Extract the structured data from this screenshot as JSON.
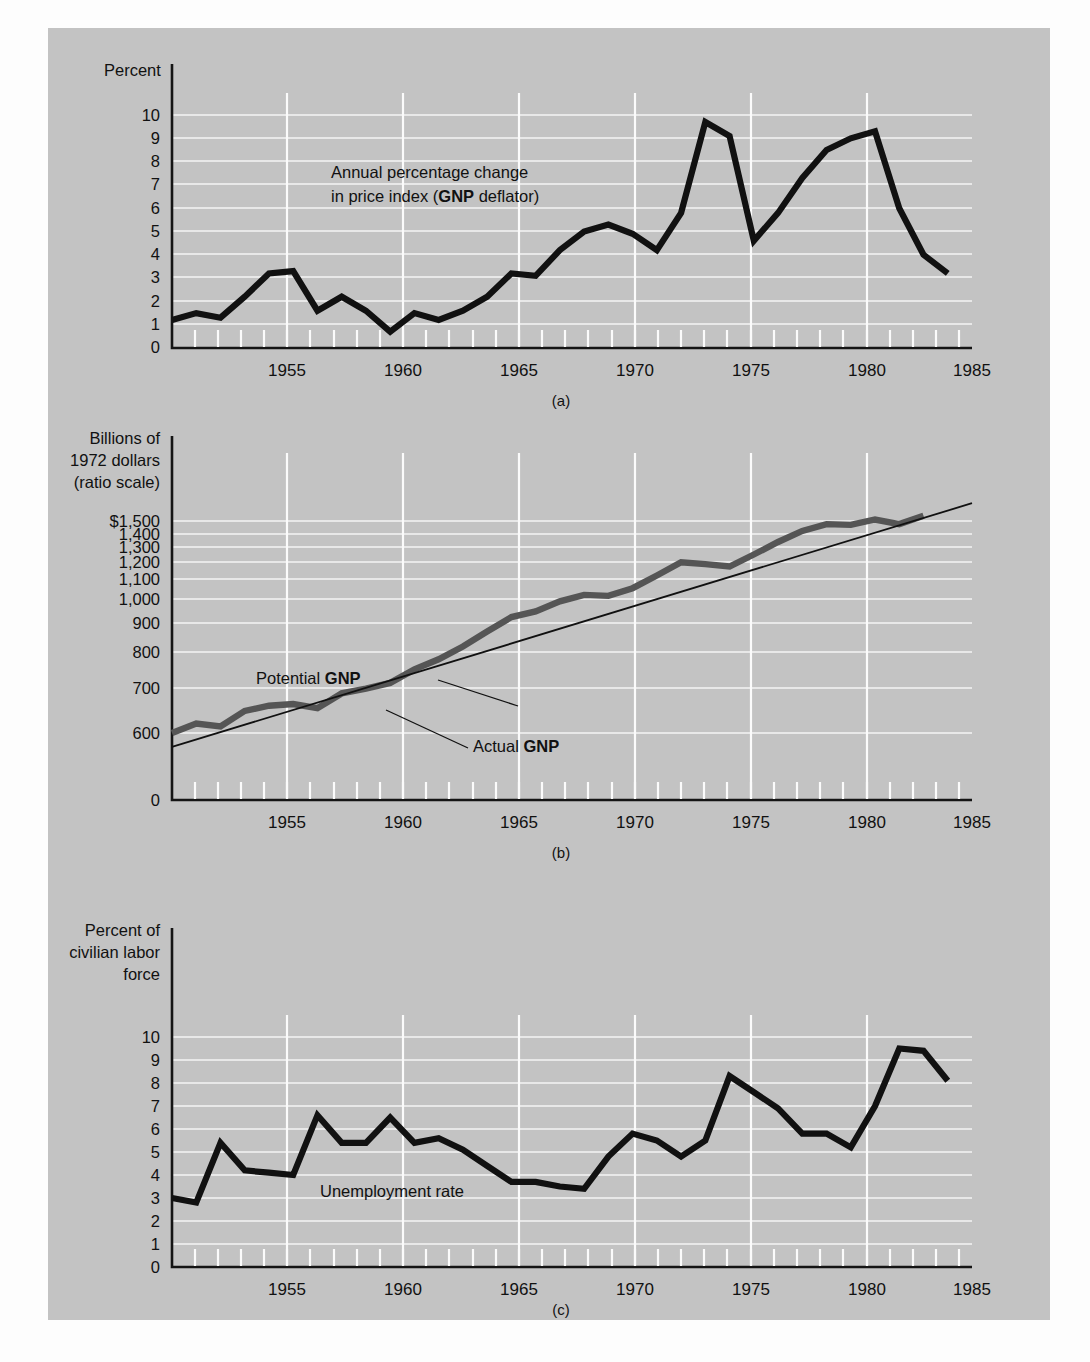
{
  "figure": {
    "background_color": "#c3c3c3",
    "page_color": "#fdfdfd",
    "captions": {
      "a": "(a)",
      "b": "(b)",
      "c": "(c)"
    }
  },
  "chart_data": [
    {
      "id": "a",
      "type": "line",
      "title": "",
      "caption": "(a)",
      "ylabel": "Percent",
      "xlabel": "",
      "annotation": "Annual percentage change in price index (GNP deflator)",
      "annotation_line1": "Annual percentage change",
      "annotation_line2_pre": "in price index (",
      "annotation_line2_bold": "GNP",
      "annotation_line2_post": " deflator)",
      "ytick_labels": [
        "0",
        "1",
        "2",
        "3",
        "4",
        "5",
        "6",
        "7",
        "8",
        "9",
        "10"
      ],
      "ytick_values": [
        0,
        1,
        2,
        3,
        4,
        5,
        6,
        7,
        8,
        9,
        10
      ],
      "xtick_labels": [
        "1955",
        "1960",
        "1965",
        "1970",
        "1975",
        "1980",
        "1985"
      ],
      "xtick_values": [
        1955,
        1960,
        1965,
        1970,
        1975,
        1980,
        1985
      ],
      "xlim": [
        1952,
        1985
      ],
      "ylim": [
        0,
        10.6
      ],
      "grid": true,
      "series": [
        {
          "name": "Annual percentage change in price index (GNP deflator)",
          "color": "#111111",
          "x": [
            1952,
            1953,
            1954,
            1955,
            1956,
            1957,
            1958,
            1959,
            1960,
            1961,
            1962,
            1963,
            1964,
            1965,
            1966,
            1967,
            1968,
            1969,
            1970,
            1971,
            1972,
            1973,
            1974,
            1975,
            1976,
            1977,
            1978,
            1979,
            1980,
            1981,
            1982,
            1983,
            1984
          ],
          "values": [
            1.2,
            1.5,
            1.3,
            2.2,
            3.2,
            3.3,
            1.6,
            2.2,
            1.6,
            0.7,
            1.5,
            1.2,
            1.6,
            2.2,
            3.2,
            3.1,
            4.2,
            5.0,
            5.3,
            4.9,
            4.2,
            5.8,
            9.7,
            9.1,
            4.6,
            5.8,
            7.3,
            8.5,
            9.0,
            9.3,
            6.0,
            4.0,
            3.2
          ]
        }
      ]
    },
    {
      "id": "b",
      "type": "line",
      "title": "",
      "caption": "(b)",
      "ylabel_line1": "Billions of",
      "ylabel_line2": "1972 dollars",
      "ylabel_line3": "(ratio scale)",
      "ylabel": "Billions of 1972 dollars (ratio scale)",
      "scale": "log",
      "ytick_labels": [
        "0",
        "600",
        "700",
        "800",
        "900",
        "1,000",
        "1,100",
        "1,200",
        "1,300",
        "1,400",
        "$1,500"
      ],
      "ytick_values": [
        0,
        600,
        700,
        800,
        900,
        1000,
        1100,
        1200,
        1300,
        1400,
        1500
      ],
      "xtick_labels": [
        "1955",
        "1960",
        "1965",
        "1970",
        "1975",
        "1980",
        "1985"
      ],
      "xtick_values": [
        1955,
        1960,
        1965,
        1970,
        1975,
        1980,
        1985
      ],
      "xlim": [
        1952,
        1985
      ],
      "ylim": [
        560,
        1620
      ],
      "grid": true,
      "labels": [
        {
          "text_pre": "Potential ",
          "text_bold": "GNP",
          "text": "Potential GNP"
        },
        {
          "text_pre": "Actual ",
          "text_bold": "GNP",
          "text": "Actual GNP"
        }
      ],
      "series": [
        {
          "name": "Potential GNP",
          "color": "#111111",
          "style": "thin",
          "x": [
            1952,
            1985
          ],
          "values": [
            565,
            1620
          ]
        },
        {
          "name": "Actual GNP",
          "color": "#555555",
          "style": "thick",
          "x": [
            1952,
            1953,
            1954,
            1955,
            1956,
            1957,
            1958,
            1959,
            1960,
            1961,
            1962,
            1963,
            1964,
            1965,
            1966,
            1967,
            1968,
            1969,
            1970,
            1971,
            1972,
            1973,
            1974,
            1975,
            1976,
            1977,
            1978,
            1979,
            1980,
            1981,
            1982,
            1983
          ],
          "values": [
            600,
            625,
            617,
            660,
            675,
            680,
            668,
            712,
            727,
            745,
            790,
            825,
            872,
            930,
            990,
            1015,
            1060,
            1090,
            1085,
            1122,
            1185,
            1255,
            1245,
            1232,
            1298,
            1370,
            1437,
            1480,
            1475,
            1510,
            1480,
            1535
          ]
        }
      ]
    },
    {
      "id": "c",
      "type": "line",
      "title": "",
      "caption": "(c)",
      "ylabel_line1": "Percent of",
      "ylabel_line2": "civilian labor",
      "ylabel_line3": "force",
      "ylabel": "Percent of civilian labor force",
      "annotation": "Unemployment rate",
      "ytick_labels": [
        "0",
        "1",
        "2",
        "3",
        "4",
        "5",
        "6",
        "7",
        "8",
        "9",
        "10"
      ],
      "ytick_values": [
        0,
        1,
        2,
        3,
        4,
        5,
        6,
        7,
        8,
        9,
        10
      ],
      "xtick_labels": [
        "1955",
        "1960",
        "1965",
        "1970",
        "1975",
        "1980",
        "1985"
      ],
      "xtick_values": [
        1955,
        1960,
        1965,
        1970,
        1975,
        1980,
        1985
      ],
      "xlim": [
        1952,
        1985
      ],
      "ylim": [
        0,
        10.6
      ],
      "grid": true,
      "series": [
        {
          "name": "Unemployment rate",
          "color": "#111111",
          "x": [
            1952,
            1953,
            1954,
            1955,
            1956,
            1957,
            1958,
            1959,
            1960,
            1961,
            1962,
            1963,
            1964,
            1965,
            1966,
            1967,
            1968,
            1969,
            1970,
            1971,
            1972,
            1973,
            1974,
            1975,
            1976,
            1977,
            1978,
            1979,
            1980,
            1981,
            1982,
            1983,
            1984
          ],
          "values": [
            3.0,
            2.8,
            5.4,
            4.2,
            4.1,
            4.0,
            6.6,
            5.4,
            5.4,
            6.5,
            5.4,
            5.6,
            5.1,
            4.4,
            3.7,
            3.7,
            3.5,
            3.4,
            4.8,
            5.8,
            5.5,
            4.8,
            5.5,
            8.3,
            7.6,
            6.9,
            5.8,
            5.8,
            5.2,
            7.0,
            9.5,
            9.4,
            8.1
          ]
        }
      ]
    }
  ]
}
